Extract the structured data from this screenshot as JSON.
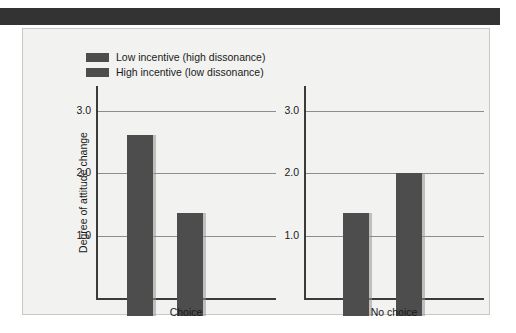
{
  "figure": {
    "header_bar_color": "#333333",
    "panel_background": "#f2f2f0",
    "bar_color": "#4d4d4d"
  },
  "chart_data": {
    "type": "bar",
    "title": "",
    "subtitle": "",
    "xlabel": "",
    "ylabel": "Degree of attitude change",
    "ylim": [
      0,
      3.4
    ],
    "yticks": [
      "1.0",
      "2.0",
      "3.0"
    ],
    "ytick_values": [
      1.0,
      2.0,
      3.0
    ],
    "grid": true,
    "legend_position": "top-left",
    "categories": [
      "Choice",
      "No choice"
    ],
    "series": [
      {
        "name": "Low incentive (high dissonance)",
        "color": "#4d4d4d",
        "values": [
          2.9,
          1.65
        ]
      },
      {
        "name": "High incentive (low dissonance)",
        "color": "#4d4d4d",
        "values": [
          1.65,
          2.3
        ]
      }
    ],
    "panels": [
      {
        "label": "Choice",
        "yticks": [
          "1.0",
          "2.0",
          "3.0"
        ],
        "bars": [
          {
            "series": "Low incentive (high dissonance)",
            "value": 2.9
          },
          {
            "series": "High incentive (low dissonance)",
            "value": 1.65
          }
        ]
      },
      {
        "label": "No choice",
        "yticks": [
          "1.0",
          "2.0",
          "3.0"
        ],
        "bars": [
          {
            "series": "Low incentive (high dissonance)",
            "value": 1.65
          },
          {
            "series": "High incentive (low dissonance)",
            "value": 2.3
          }
        ]
      }
    ]
  },
  "legend": {
    "items": [
      {
        "label": "Low incentive (high dissonance)",
        "color": "#4d4d4d"
      },
      {
        "label": "High incentive (low dissonance)",
        "color": "#4d4d4d"
      }
    ]
  }
}
